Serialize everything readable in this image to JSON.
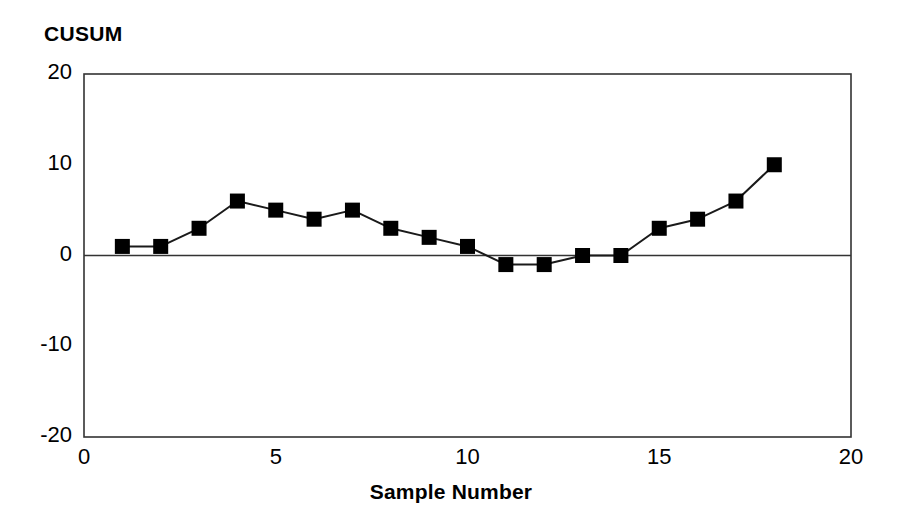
{
  "chart_data": {
    "type": "line",
    "title": "CUSUM",
    "xlabel": "Sample Number",
    "ylabel": "CUSUM",
    "x": [
      1,
      2,
      3,
      4,
      5,
      6,
      7,
      8,
      9,
      10,
      11,
      12,
      13,
      14,
      15,
      16,
      17,
      18
    ],
    "values": [
      1,
      1,
      3,
      6,
      5,
      4,
      5,
      3,
      2,
      1,
      -1,
      -1,
      0,
      0,
      3,
      4,
      6,
      10
    ],
    "series": [
      {
        "name": "CUSUM",
        "values": [
          1,
          1,
          3,
          6,
          5,
          4,
          5,
          3,
          2,
          1,
          -1,
          -1,
          0,
          0,
          3,
          4,
          6,
          10
        ]
      }
    ],
    "xlim": [
      0,
      20
    ],
    "ylim": [
      -20,
      20
    ],
    "xticks": [
      0,
      5,
      10,
      15,
      20
    ],
    "yticks": [
      20,
      10,
      0,
      -10,
      -20
    ],
    "xtick_labels": [
      "0",
      "5",
      "10",
      "15",
      "20"
    ],
    "ytick_labels": [
      "20",
      "10",
      "0",
      "-10",
      "-20"
    ],
    "grid": false,
    "legend": null,
    "zero_line": 0,
    "marker": "square",
    "marker_color": "#000000",
    "line_color": "#1a1a1a",
    "axis_color": "#333333",
    "background": "#ffffff"
  },
  "axes": {
    "y_ticks": [
      {
        "label": "20",
        "value": 20
      },
      {
        "label": "10",
        "value": 10
      },
      {
        "label": "0",
        "value": 0
      },
      {
        "label": "-10",
        "value": -10
      },
      {
        "label": "-20",
        "value": -20
      }
    ],
    "x_ticks": [
      {
        "label": "0",
        "value": 0
      },
      {
        "label": "5",
        "value": 5
      },
      {
        "label": "10",
        "value": 10
      },
      {
        "label": "15",
        "value": 15
      },
      {
        "label": "20",
        "value": 20
      }
    ]
  }
}
